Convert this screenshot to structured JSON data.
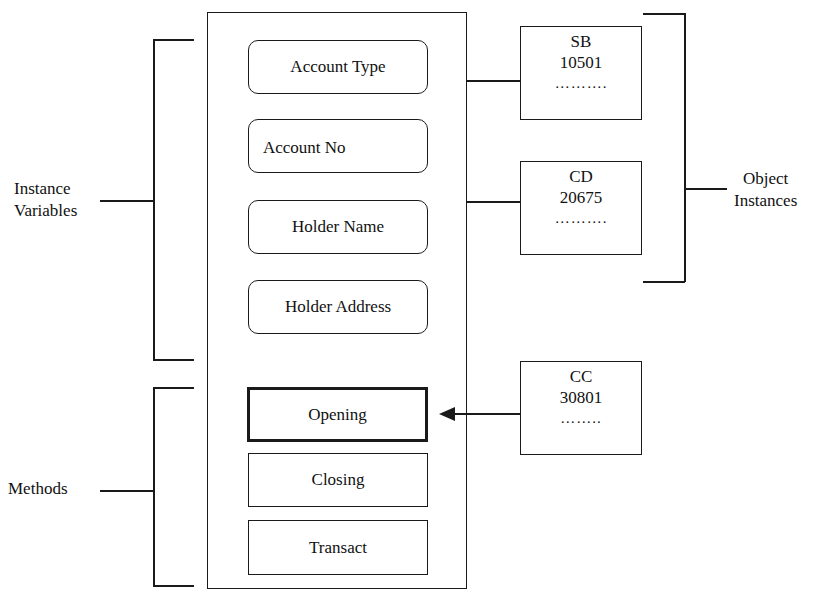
{
  "diagram": {
    "class": {
      "instance_variables": [
        {
          "label": "Account Type",
          "shape": "rounded"
        },
        {
          "label": "Account No",
          "shape": "rounded"
        },
        {
          "label": "Holder Name",
          "shape": "rounded"
        },
        {
          "label": "Holder Address",
          "shape": "rounded"
        }
      ],
      "methods": [
        {
          "label": "Opening",
          "shape": "rect",
          "highlighted": true
        },
        {
          "label": "Closing",
          "shape": "rect",
          "highlighted": false
        },
        {
          "label": "Transact",
          "shape": "rect",
          "highlighted": false
        }
      ]
    },
    "object_instances": [
      {
        "type": "SB",
        "number": "10501",
        "more": "………."
      },
      {
        "type": "CD",
        "number": "20675",
        "more": "………."
      },
      {
        "type": "CC",
        "number": "30801",
        "more": "…….."
      }
    ],
    "labels": {
      "instance_variables_line1": "Instance",
      "instance_variables_line2": "Variables",
      "methods": "Methods",
      "object_instances_line1": "Object",
      "object_instances_line2": "Instances"
    },
    "connections": [
      {
        "from": "SB",
        "to": "class",
        "type": "line"
      },
      {
        "from": "CD",
        "to": "class",
        "type": "line"
      },
      {
        "from": "CC",
        "to": "Opening",
        "type": "arrow"
      }
    ],
    "colors": {
      "stroke": "#1a1a1a",
      "background": "#ffffff"
    }
  }
}
